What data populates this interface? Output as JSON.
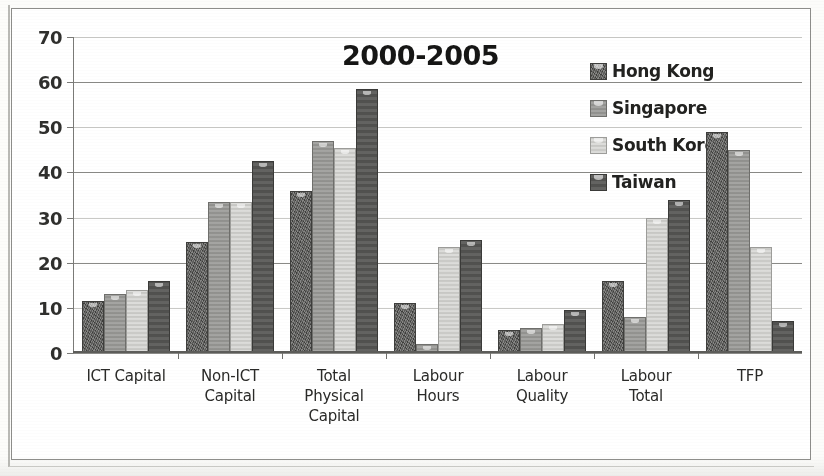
{
  "chart_data": {
    "type": "bar",
    "title": "2000-2005",
    "xlabel": "",
    "ylabel": "",
    "ylim": [
      0,
      70
    ],
    "ytick_step": 10,
    "yticks": [
      0,
      10,
      20,
      30,
      40,
      50,
      60,
      70
    ],
    "grid": true,
    "legend_position": "top-right",
    "categories": [
      "ICT Capital",
      "Non-ICT Capital",
      "Total Physical Capital",
      "Labour Hours",
      "Labour Quality",
      "Labour Total",
      "TFP"
    ],
    "category_lines": [
      [
        "ICT Capital"
      ],
      [
        "Non-ICT",
        "Capital"
      ],
      [
        "Total",
        "Physical",
        "Capital"
      ],
      [
        "Labour",
        "Hours"
      ],
      [
        "Labour",
        "Quality"
      ],
      [
        "Labour",
        "Total"
      ],
      [
        "TFP"
      ]
    ],
    "series": [
      {
        "name": "Hong Kong",
        "color": "#5c5c5a",
        "values": [
          11.5,
          24.5,
          36.0,
          11.0,
          5.0,
          16.0,
          49.0
        ]
      },
      {
        "name": "Singapore",
        "color": "#9a9a97",
        "values": [
          13.0,
          33.5,
          47.0,
          2.0,
          5.5,
          8.0,
          45.0
        ]
      },
      {
        "name": "South Korea",
        "color": "#d2d2cf",
        "values": [
          14.0,
          33.5,
          45.5,
          23.5,
          6.5,
          30.0,
          23.5
        ]
      },
      {
        "name": "Taiwan",
        "color": "#575755",
        "values": [
          16.0,
          42.5,
          58.5,
          25.0,
          9.5,
          34.0,
          7.0
        ]
      }
    ]
  }
}
